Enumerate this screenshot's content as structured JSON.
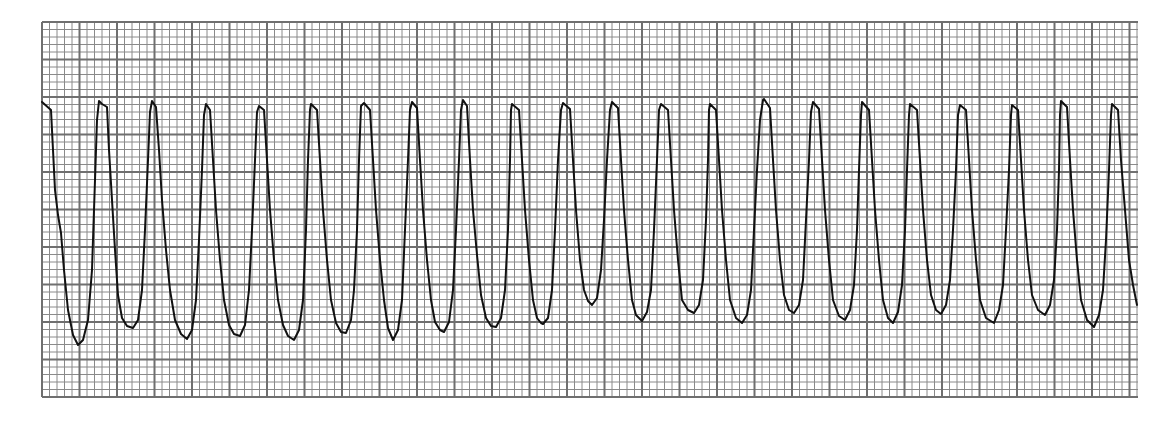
{
  "title": "ECG rhythm strip",
  "colors": {
    "background": "#ffffff",
    "grid_minor": "#8a8a8a",
    "grid_major": "#6f6f6f",
    "trace": "#111111"
  },
  "grid": {
    "left": 42,
    "top": 22,
    "right": 1138,
    "bottom": 397,
    "minor_px": 7.5,
    "major_px": 37.5
  },
  "chart_data": {
    "type": "line",
    "title": "",
    "xlabel": "",
    "ylabel": "",
    "grid": true,
    "legend": null,
    "peaks_x_px": [
      99,
      152,
      206,
      259,
      311,
      361,
      412,
      463,
      512,
      563,
      612,
      661,
      710,
      764,
      813,
      862,
      910,
      960,
      1012,
      1061,
      1112
    ],
    "trace_points": [
      [
        42,
        102
      ],
      [
        51,
        110
      ],
      [
        53,
        150
      ],
      [
        55,
        190
      ],
      [
        58,
        215
      ],
      [
        61,
        233
      ],
      [
        64,
        270
      ],
      [
        68,
        310
      ],
      [
        73,
        335
      ],
      [
        78,
        345
      ],
      [
        83,
        340
      ],
      [
        88,
        320
      ],
      [
        92,
        270
      ],
      [
        95,
        180
      ],
      [
        97,
        120
      ],
      [
        99,
        101
      ],
      [
        102,
        104
      ],
      [
        107,
        107
      ],
      [
        109,
        150
      ],
      [
        112,
        200
      ],
      [
        115,
        250
      ],
      [
        118,
        295
      ],
      [
        122,
        318
      ],
      [
        127,
        326
      ],
      [
        133,
        328
      ],
      [
        138,
        320
      ],
      [
        142,
        290
      ],
      [
        145,
        230
      ],
      [
        148,
        160
      ],
      [
        150,
        112
      ],
      [
        152,
        101
      ],
      [
        156,
        107
      ],
      [
        159,
        150
      ],
      [
        162,
        200
      ],
      [
        166,
        250
      ],
      [
        170,
        290
      ],
      [
        175,
        320
      ],
      [
        181,
        334
      ],
      [
        187,
        339
      ],
      [
        192,
        330
      ],
      [
        196,
        300
      ],
      [
        199,
        240
      ],
      [
        202,
        170
      ],
      [
        204,
        115
      ],
      [
        206,
        104
      ],
      [
        210,
        110
      ],
      [
        213,
        160
      ],
      [
        216,
        210
      ],
      [
        220,
        260
      ],
      [
        224,
        300
      ],
      [
        229,
        325
      ],
      [
        234,
        334
      ],
      [
        240,
        336
      ],
      [
        245,
        325
      ],
      [
        249,
        290
      ],
      [
        252,
        230
      ],
      [
        255,
        160
      ],
      [
        257,
        112
      ],
      [
        259,
        106
      ],
      [
        264,
        110
      ],
      [
        267,
        160
      ],
      [
        270,
        210
      ],
      [
        274,
        260
      ],
      [
        278,
        300
      ],
      [
        283,
        325
      ],
      [
        288,
        336
      ],
      [
        294,
        340
      ],
      [
        299,
        330
      ],
      [
        303,
        300
      ],
      [
        306,
        230
      ],
      [
        308,
        160
      ],
      [
        310,
        110
      ],
      [
        311,
        104
      ],
      [
        317,
        110
      ],
      [
        320,
        160
      ],
      [
        323,
        210
      ],
      [
        327,
        260
      ],
      [
        331,
        300
      ],
      [
        336,
        323
      ],
      [
        341,
        332
      ],
      [
        346,
        333
      ],
      [
        351,
        320
      ],
      [
        354,
        290
      ],
      [
        357,
        230
      ],
      [
        359,
        160
      ],
      [
        361,
        106
      ],
      [
        364,
        103
      ],
      [
        370,
        110
      ],
      [
        373,
        160
      ],
      [
        376,
        210
      ],
      [
        380,
        260
      ],
      [
        384,
        300
      ],
      [
        388,
        328
      ],
      [
        393,
        340
      ],
      [
        398,
        330
      ],
      [
        402,
        300
      ],
      [
        405,
        230
      ],
      [
        408,
        160
      ],
      [
        410,
        110
      ],
      [
        412,
        102
      ],
      [
        417,
        108
      ],
      [
        420,
        160
      ],
      [
        423,
        210
      ],
      [
        427,
        260
      ],
      [
        431,
        300
      ],
      [
        435,
        322
      ],
      [
        440,
        330
      ],
      [
        444,
        332
      ],
      [
        449,
        322
      ],
      [
        453,
        290
      ],
      [
        456,
        230
      ],
      [
        459,
        160
      ],
      [
        461,
        110
      ],
      [
        463,
        100
      ],
      [
        467,
        106
      ],
      [
        470,
        160
      ],
      [
        473,
        210
      ],
      [
        477,
        255
      ],
      [
        481,
        295
      ],
      [
        486,
        318
      ],
      [
        491,
        326
      ],
      [
        496,
        327
      ],
      [
        501,
        318
      ],
      [
        505,
        290
      ],
      [
        508,
        230
      ],
      [
        510,
        160
      ],
      [
        511,
        110
      ],
      [
        512,
        104
      ],
      [
        519,
        110
      ],
      [
        522,
        160
      ],
      [
        525,
        210
      ],
      [
        529,
        260
      ],
      [
        533,
        300
      ],
      [
        537,
        318
      ],
      [
        541,
        323
      ],
      [
        543,
        324
      ],
      [
        548,
        318
      ],
      [
        552,
        290
      ],
      [
        555,
        230
      ],
      [
        558,
        160
      ],
      [
        561,
        110
      ],
      [
        563,
        103
      ],
      [
        570,
        109
      ],
      [
        573,
        160
      ],
      [
        576,
        210
      ],
      [
        580,
        260
      ],
      [
        584,
        290
      ],
      [
        588,
        301
      ],
      [
        592,
        305
      ],
      [
        597,
        298
      ],
      [
        601,
        270
      ],
      [
        604,
        220
      ],
      [
        607,
        160
      ],
      [
        610,
        110
      ],
      [
        612,
        102
      ],
      [
        618,
        108
      ],
      [
        621,
        160
      ],
      [
        624,
        210
      ],
      [
        628,
        260
      ],
      [
        632,
        300
      ],
      [
        636,
        315
      ],
      [
        642,
        321
      ],
      [
        647,
        312
      ],
      [
        651,
        290
      ],
      [
        654,
        230
      ],
      [
        657,
        160
      ],
      [
        659,
        110
      ],
      [
        661,
        104
      ],
      [
        668,
        110
      ],
      [
        671,
        160
      ],
      [
        674,
        210
      ],
      [
        678,
        260
      ],
      [
        682,
        300
      ],
      [
        688,
        310
      ],
      [
        694,
        313
      ],
      [
        699,
        305
      ],
      [
        703,
        280
      ],
      [
        706,
        220
      ],
      [
        708,
        160
      ],
      [
        709,
        110
      ],
      [
        710,
        104
      ],
      [
        716,
        110
      ],
      [
        719,
        160
      ],
      [
        722,
        210
      ],
      [
        726,
        260
      ],
      [
        730,
        300
      ],
      [
        736,
        318
      ],
      [
        742,
        323
      ],
      [
        747,
        315
      ],
      [
        751,
        290
      ],
      [
        754,
        230
      ],
      [
        757,
        170
      ],
      [
        760,
        120
      ],
      [
        763,
        100
      ],
      [
        764,
        99
      ],
      [
        770,
        108
      ],
      [
        773,
        160
      ],
      [
        776,
        210
      ],
      [
        780,
        260
      ],
      [
        784,
        295
      ],
      [
        789,
        310
      ],
      [
        794,
        313
      ],
      [
        799,
        305
      ],
      [
        803,
        280
      ],
      [
        806,
        220
      ],
      [
        809,
        160
      ],
      [
        811,
        112
      ],
      [
        813,
        102
      ],
      [
        819,
        109
      ],
      [
        822,
        160
      ],
      [
        825,
        210
      ],
      [
        829,
        260
      ],
      [
        833,
        300
      ],
      [
        839,
        316
      ],
      [
        845,
        320
      ],
      [
        850,
        310
      ],
      [
        854,
        285
      ],
      [
        857,
        230
      ],
      [
        859,
        170
      ],
      [
        861,
        115
      ],
      [
        862,
        102
      ],
      [
        869,
        110
      ],
      [
        872,
        160
      ],
      [
        875,
        210
      ],
      [
        879,
        260
      ],
      [
        883,
        300
      ],
      [
        888,
        318
      ],
      [
        893,
        323
      ],
      [
        898,
        312
      ],
      [
        902,
        285
      ],
      [
        905,
        230
      ],
      [
        907,
        170
      ],
      [
        909,
        115
      ],
      [
        910,
        104
      ],
      [
        917,
        110
      ],
      [
        920,
        160
      ],
      [
        923,
        210
      ],
      [
        927,
        260
      ],
      [
        931,
        295
      ],
      [
        936,
        310
      ],
      [
        941,
        314
      ],
      [
        946,
        305
      ],
      [
        950,
        280
      ],
      [
        953,
        230
      ],
      [
        956,
        170
      ],
      [
        958,
        115
      ],
      [
        960,
        105
      ],
      [
        966,
        110
      ],
      [
        969,
        160
      ],
      [
        972,
        210
      ],
      [
        976,
        260
      ],
      [
        980,
        300
      ],
      [
        986,
        318
      ],
      [
        994,
        323
      ],
      [
        999,
        310
      ],
      [
        1003,
        285
      ],
      [
        1006,
        230
      ],
      [
        1009,
        170
      ],
      [
        1011,
        115
      ],
      [
        1012,
        105
      ],
      [
        1018,
        110
      ],
      [
        1021,
        160
      ],
      [
        1024,
        210
      ],
      [
        1028,
        260
      ],
      [
        1032,
        295
      ],
      [
        1038,
        310
      ],
      [
        1045,
        315
      ],
      [
        1050,
        305
      ],
      [
        1054,
        280
      ],
      [
        1057,
        230
      ],
      [
        1059,
        170
      ],
      [
        1060,
        115
      ],
      [
        1061,
        101
      ],
      [
        1067,
        107
      ],
      [
        1070,
        160
      ],
      [
        1073,
        210
      ],
      [
        1077,
        260
      ],
      [
        1081,
        300
      ],
      [
        1087,
        320
      ],
      [
        1094,
        327
      ],
      [
        1099,
        315
      ],
      [
        1103,
        290
      ],
      [
        1106,
        240
      ],
      [
        1109,
        170
      ],
      [
        1111,
        115
      ],
      [
        1112,
        104
      ],
      [
        1118,
        110
      ],
      [
        1121,
        160
      ],
      [
        1125,
        210
      ],
      [
        1129,
        260
      ],
      [
        1133,
        285
      ],
      [
        1137,
        305
      ]
    ]
  }
}
